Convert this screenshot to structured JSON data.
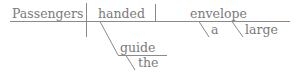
{
  "diagram": {
    "type": "reed-kellogg sentence diagram",
    "subject": "Passengers",
    "verb": "handed",
    "direct_object": "envelope",
    "direct_object_modifiers": [
      "a",
      "large"
    ],
    "indirect_object": "guide",
    "indirect_object_modifiers": [
      "the"
    ]
  },
  "colors": {
    "ink": "#7a7a7a",
    "line": "#8a8a8a",
    "background": "#ffffff"
  }
}
